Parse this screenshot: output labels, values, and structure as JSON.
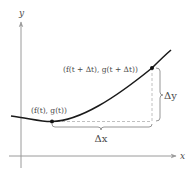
{
  "diagram": {
    "type": "parametric-curve-secant",
    "axes": {
      "x_label": "x",
      "y_label": "y"
    },
    "points": {
      "start_label": "(f(t), g(t))",
      "end_label": "(f(t + Δt), g(t + Δt))"
    },
    "brackets": {
      "horizontal_label": "Δx",
      "vertical_label": "Δy"
    },
    "colors": {
      "curve": "#1a1a1a",
      "axes": "#9a9a9a",
      "dashed": "#b0b0b0",
      "bracket": "#8a8a8a",
      "text": "#4a4a4a"
    }
  }
}
